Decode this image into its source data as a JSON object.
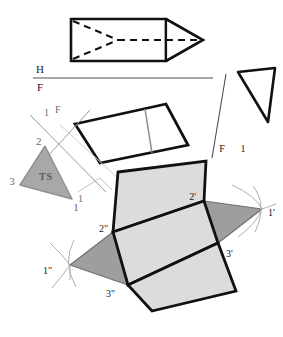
{
  "drawing": {
    "title": "Orthographic views and surface development of a triangular wedge prism",
    "background_color": "#ffffff",
    "line_color": "#111111",
    "construction_line_color": "#9a9a9a",
    "fold_line_color": "#4d4d4d",
    "panel_fill_light": "#dcdcdc",
    "panel_fill_mid": "#b9b9b9",
    "panel_fill_dark": "#9e9e9e",
    "triangle_ts_fill": "#a8a8a8"
  },
  "views": {
    "top_view": {
      "name": "top-view-prism",
      "description": "Rectangle with pointed wedge at right, hidden edges dashed"
    },
    "front_view": {
      "name": "front-view-parallelogram",
      "description": "Parallelogram with internal edge line"
    },
    "right_triangle_view": {
      "name": "auxiliary-triangle-view",
      "description": "Triangle outline at upper right"
    },
    "true_size_view": {
      "name": "true-size-triangle",
      "label": "TS"
    },
    "development": {
      "name": "surface-development",
      "description": "Unfolded pattern of prism faces"
    }
  },
  "fold_lines": {
    "hf": {
      "upper": "H",
      "lower": "F"
    },
    "f1_right": {
      "left": "F",
      "right": "1"
    },
    "f1_left": {
      "upper": "F",
      "lower_left": "2",
      "left": "1"
    }
  },
  "labels": {
    "hf_h": "H",
    "hf_f": "F",
    "right_f": "F",
    "right_one": "1",
    "aux_f": "F",
    "aux_one_top": "1",
    "aux_two": "2",
    "ts_text": "TS",
    "ts_three": "3",
    "ts_one": "1",
    "dev_one_prime": "1'",
    "dev_two_prime": "2'",
    "dev_three_prime": "3'",
    "dev_one_dprime": "1\"",
    "dev_two_dprime": "2\"",
    "dev_three_dprime": "3\"",
    "dev_one_mid": "1"
  }
}
